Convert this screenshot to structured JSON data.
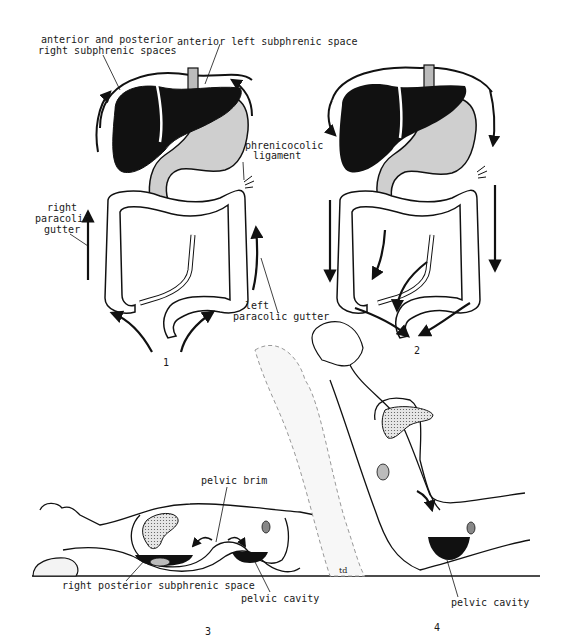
{
  "figure": {
    "panels": [
      {
        "number": "1",
        "description": "Upward flow of peritoneal fluid along paracolic gutters to subphrenic spaces"
      },
      {
        "number": "2",
        "description": "Downward flow of peritoneal fluid toward pelvis"
      },
      {
        "number": "3",
        "description": "Supine patient: fluid pools in right posterior subphrenic space and pelvic cavity"
      },
      {
        "number": "4",
        "description": "Semi-upright patient: fluid flows into pelvic cavity"
      }
    ],
    "labels": {
      "ant_post_right_line1": "anterior and posterior",
      "ant_post_right_line2": "right subphrenic spaces",
      "anterior_left": "anterior left subphrenic space",
      "phrenicocolic_line1": "phrenicocolic",
      "phrenicocolic_line2": "ligament",
      "right_gutter_line1": "right",
      "right_gutter_line2": "paracolic",
      "right_gutter_line3": "gutter",
      "left_gutter_line1": "left",
      "left_gutter_line2": "paracolic gutter",
      "pelvic_brim": "pelvic brim",
      "right_posterior": "right posterior subphrenic space",
      "pelvic_cavity_3": "pelvic cavity",
      "pelvic_cavity_4": "pelvic cavity",
      "signature": "td"
    },
    "panel_numbers": {
      "p1": "1",
      "p2": "2",
      "p3": "3",
      "p4": "4"
    },
    "colors": {
      "liver": "#111111",
      "stomach": "#cfcfcf",
      "fluid": "#111111",
      "outline": "#1a1a1a"
    }
  }
}
